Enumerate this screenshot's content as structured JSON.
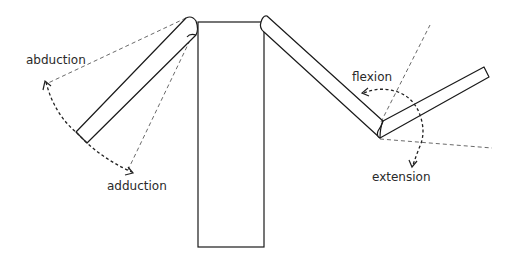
{
  "diagram": {
    "type": "joint-movement-illustration",
    "labels": {
      "abduction": "abduction",
      "adduction": "adduction",
      "flexion": "flexion",
      "extension": "extension"
    },
    "parts": {
      "body": "torso rectangle",
      "left_arm": "arm segment abducted at shoulder",
      "right_upper_arm": "upper arm segment",
      "right_forearm": "forearm segment flexed at elbow"
    },
    "colors": {
      "line": "#1a1a1a",
      "text": "#2a2a2a",
      "background": "#ffffff"
    }
  }
}
